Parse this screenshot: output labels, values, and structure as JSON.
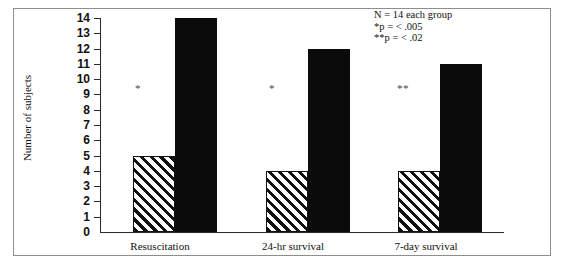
{
  "chart_data": {
    "type": "bar",
    "title": "",
    "subtitle": "",
    "xlabel": "",
    "ylabel": "Number of subjects",
    "ylim": [
      0,
      14
    ],
    "grid": false,
    "legend_position": "none",
    "categories": [
      "Resuscitation",
      "24-hr survival",
      "7-day survival"
    ],
    "ytick_labels": [
      "0",
      "1",
      "2",
      "3",
      "4",
      "5",
      "6",
      "7",
      "8",
      "9",
      "10",
      "11",
      "12",
      "13",
      "14"
    ],
    "series": [
      {
        "name": "hatched",
        "values": [
          5,
          4,
          4
        ]
      },
      {
        "name": "solid",
        "values": [
          14,
          12,
          11
        ]
      }
    ],
    "annotations": [
      "N  =  14 each group",
      "*p  =  <  .005",
      "**p  =  <  .02"
    ],
    "significance_markers": [
      "*",
      "*",
      "**"
    ]
  },
  "axis": {
    "y_title": "Number of subjects",
    "ticks": [
      "14",
      "13",
      "12",
      "11",
      "10",
      "9",
      "8",
      "7",
      "6",
      "5",
      "4",
      "3",
      "2",
      "1",
      "0"
    ]
  },
  "categories": {
    "c0": "Resuscitation",
    "c1": "24-hr survival",
    "c2": "7-day survival"
  },
  "notes": {
    "n_line": "N  =  14 each group",
    "p_one": "*p  =  <  .005",
    "p_two": "**p  =  <  .02"
  },
  "markers": {
    "m0": "*",
    "m1": "*",
    "m2": "**"
  },
  "colors": {
    "solid_bar": "#0b0b0b",
    "hatch_stroke": "#111111",
    "axis": "#2b2b2b",
    "frame": "#8e8e8e",
    "background": "#ffffff"
  }
}
